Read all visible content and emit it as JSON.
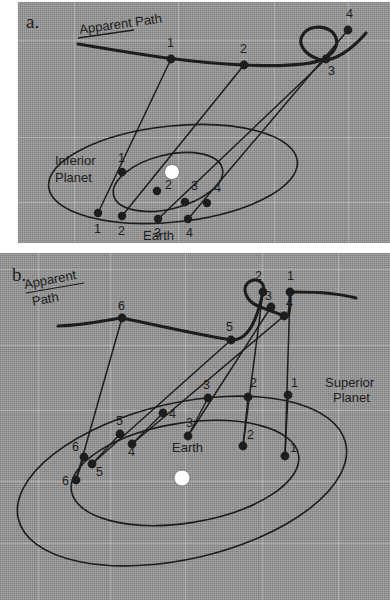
{
  "figure": {
    "type": "astronomy-diagram",
    "background_color": "#9a9a9a",
    "ink_color": "#1d1d1d",
    "sun_color": "#ffffff"
  },
  "panel_a": {
    "id": "a.",
    "apparent_path_label": "Apparent Path",
    "inferior_planet_label": "Inferior Planet",
    "inferior_planet_label_line1": "Inferior",
    "inferior_planet_label_line2": "Planet",
    "earth_label": "Earth",
    "sky_point_labels": [
      "1",
      "2",
      "3",
      "4"
    ],
    "planet_point_labels": [
      "1",
      "2",
      "3",
      "4"
    ],
    "earth_point_labels": [
      "1",
      "2",
      "3",
      "4"
    ],
    "sky_points": [
      {
        "label": "1",
        "x": 153,
        "y": 57
      },
      {
        "label": "2",
        "x": 226,
        "y": 63
      },
      {
        "label": "3",
        "x": 308,
        "y": 57
      },
      {
        "label": "4",
        "x": 330,
        "y": 28
      }
    ],
    "planet_points": [
      {
        "label": "1",
        "x": 104,
        "y": 170
      },
      {
        "label": "2",
        "x": 139,
        "y": 189
      },
      {
        "label": "3",
        "x": 167,
        "y": 200
      },
      {
        "label": "4",
        "x": 189,
        "y": 201
      }
    ],
    "earth_points": [
      {
        "label": "1",
        "x": 80,
        "y": 211
      },
      {
        "label": "2",
        "x": 104,
        "y": 214
      },
      {
        "label": "3",
        "x": 140,
        "y": 217
      },
      {
        "label": "4",
        "x": 170,
        "y": 217
      }
    ],
    "sun": {
      "x": 154,
      "y": 170
    }
  },
  "panel_b": {
    "id": "b.",
    "apparent_path_label": "Apparent Path",
    "apparent_path_label_line1": "Apparent",
    "apparent_path_label_line2": "Path",
    "superior_planet_label": "Superior Planet",
    "superior_planet_label_line1": "Superior",
    "superior_planet_label_line2": "Planet",
    "earth_label": "Earth",
    "sky_point_labels": [
      "1",
      "2",
      "3",
      "4",
      "5",
      "6"
    ],
    "planet_point_labels": [
      "1",
      "2",
      "3",
      "4",
      "5",
      "6"
    ],
    "earth_point_labels": [
      "1",
      "2",
      "3",
      "4",
      "5",
      "6"
    ],
    "sky_points": [
      {
        "label": "1",
        "x": 290,
        "y": 292
      },
      {
        "label": "2",
        "x": 263,
        "y": 292
      },
      {
        "label": "3",
        "x": 271,
        "y": 307
      },
      {
        "label": "4",
        "x": 284,
        "y": 316
      },
      {
        "label": "5",
        "x": 231,
        "y": 340
      },
      {
        "label": "6",
        "x": 122,
        "y": 318
      }
    ],
    "planet_points": [
      {
        "label": "1",
        "x": 288,
        "y": 395
      },
      {
        "label": "2",
        "x": 248,
        "y": 397
      },
      {
        "label": "3",
        "x": 208,
        "y": 398
      },
      {
        "label": "4",
        "x": 163,
        "y": 413
      },
      {
        "label": "5",
        "x": 120,
        "y": 434
      },
      {
        "label": "6",
        "x": 84,
        "y": 457
      }
    ],
    "earth_points": [
      {
        "label": "1",
        "x": 285,
        "y": 456
      },
      {
        "label": "2",
        "x": 243,
        "y": 446
      },
      {
        "label": "3",
        "x": 188,
        "y": 436
      },
      {
        "label": "4",
        "x": 132,
        "y": 444
      },
      {
        "label": "5",
        "x": 92,
        "y": 464
      },
      {
        "label": "6",
        "x": 76,
        "y": 480
      }
    ],
    "sun": {
      "x": 182,
      "y": 478
    }
  }
}
